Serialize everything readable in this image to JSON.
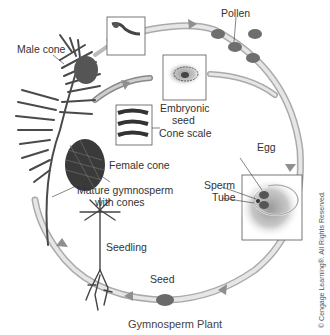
{
  "title": "Gymnosperm Plant",
  "copyright": "© Cengage Learning®. All Rights Reserved.",
  "labels": {
    "male_cone": "Male cone",
    "pollen": "Pollen",
    "embryonic_seed_1": "Embryonic",
    "embryonic_seed_2": "seed",
    "cone_scale": "Cone scale",
    "female_cone": "Female cone",
    "mature_1": "Mature gymnosperm",
    "mature_2": "with cones",
    "egg": "Egg",
    "sperm": "Sperm",
    "tube": "Tube",
    "seedling": "Seedling",
    "seed": "Seed"
  },
  "colors": {
    "cycle_arrow": "#c9c9c9",
    "arrow_head": "#8f8f8f",
    "pollen": "#6e6e6e",
    "needles": "#4a4a4a",
    "cone": "#3a3a3a",
    "box_border": "#555555"
  }
}
